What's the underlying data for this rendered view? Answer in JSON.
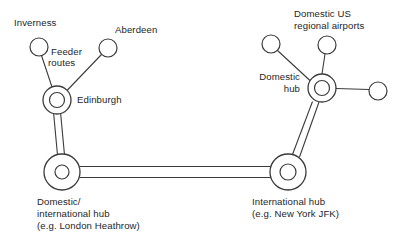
{
  "diagram": {
    "stroke_color": "#3b3b3b",
    "text_color": "#262626",
    "background_color": "#ffffff",
    "labels": {
      "inverness": "Inverness",
      "aberdeen": "Aberdeen",
      "feeder_routes_line1": "Feeder",
      "feeder_routes_line2": "routes",
      "edinburgh": "Edinburgh",
      "domestic_us_line1": "Domestic US",
      "domestic_us_line2": "regional airports",
      "domestic_hub_line1": "Domestic",
      "domestic_hub_line2": "hub",
      "london_hub_line1": "Domestic/",
      "london_hub_line2": "international hub",
      "london_hub_line3": "(e.g. London Heathrow)",
      "jfk_hub_line1": "International hub",
      "jfk_hub_line2": "(e.g. New York JFK)"
    },
    "nodes": [
      {
        "id": "inverness",
        "type": "spoke",
        "cx": 39,
        "cy": 47,
        "r": 9
      },
      {
        "id": "aberdeen",
        "type": "spoke",
        "cx": 108,
        "cy": 48,
        "r": 9
      },
      {
        "id": "edinburgh",
        "type": "hub",
        "cx": 57,
        "cy": 100,
        "r_outer": 14,
        "r_inner": 7.5
      },
      {
        "id": "london-heathrow",
        "type": "hub",
        "cx": 62,
        "cy": 172,
        "r_outer": 18,
        "r_inner": 7
      },
      {
        "id": "new-york-jfk",
        "type": "hub",
        "cx": 288,
        "cy": 172,
        "r_outer": 18,
        "r_inner": 8
      },
      {
        "id": "domestic-hub",
        "type": "hub",
        "cx": 322,
        "cy": 88,
        "r_outer": 14,
        "r_inner": 7.5
      },
      {
        "id": "us-regional-left",
        "type": "spoke",
        "cx": 271,
        "cy": 44,
        "r": 9
      },
      {
        "id": "us-regional-top",
        "type": "spoke",
        "cx": 327,
        "cy": 45,
        "r": 9
      },
      {
        "id": "us-regional-right",
        "type": "spoke",
        "cx": 378,
        "cy": 91,
        "r": 9
      }
    ],
    "edges": [
      {
        "id": "inverness-edinburgh",
        "kind": "feeder"
      },
      {
        "id": "aberdeen-edinburgh",
        "kind": "feeder"
      },
      {
        "id": "edinburgh-london",
        "kind": "trunk"
      },
      {
        "id": "london-jfk",
        "kind": "trunk"
      },
      {
        "id": "jfk-domestic-hub",
        "kind": "trunk"
      },
      {
        "id": "domestic-hub-us-left",
        "kind": "feeder"
      },
      {
        "id": "domestic-hub-us-top",
        "kind": "feeder"
      },
      {
        "id": "domestic-hub-us-right",
        "kind": "feeder"
      }
    ]
  }
}
